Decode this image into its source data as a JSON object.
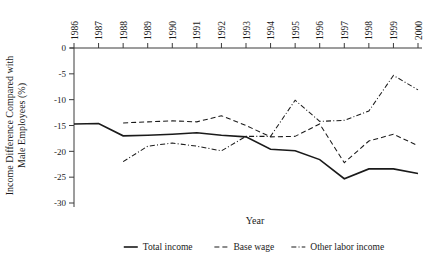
{
  "chart_data": {
    "type": "line",
    "title": "",
    "xlabel": "Year",
    "ylabel": "Income Difference Compared with Male Employees (%)",
    "x": [
      1986,
      1987,
      1988,
      1989,
      1990,
      1991,
      1992,
      1993,
      1994,
      1995,
      1996,
      1997,
      1998,
      1999,
      2000
    ],
    "categories": [
      "1986",
      "1987",
      "1988",
      "1989",
      "1990",
      "1991",
      "1992",
      "1993",
      "1994",
      "1995",
      "1996",
      "1997",
      "1998",
      "1999",
      "2000"
    ],
    "xlim": [
      1986,
      2000
    ],
    "ylim": [
      -30,
      0
    ],
    "yticks": [
      0,
      -5,
      -10,
      -15,
      -20,
      -25,
      -30
    ],
    "yticklabels": [
      "0",
      "-5",
      "-10",
      "-15",
      "-20",
      "-25",
      "-30"
    ],
    "grid": false,
    "legend_position": "bottom",
    "series": [
      {
        "name": "Total income",
        "style": "solid",
        "values": [
          -14.7,
          -14.6,
          -17.0,
          -16.9,
          -16.7,
          -16.4,
          -16.9,
          -17.2,
          -19.6,
          -19.9,
          -21.6,
          -25.3,
          -23.4,
          -23.4,
          -24.3
        ]
      },
      {
        "name": "Base wage",
        "style": "dashed",
        "values": [
          null,
          null,
          -14.5,
          -14.3,
          -14.1,
          -14.3,
          -13.1,
          -15.0,
          -17.2,
          -17.1,
          -14.7,
          -22.2,
          -18.0,
          -16.7,
          -18.9
        ]
      },
      {
        "name": "Other labor income",
        "style": "dash-dot",
        "values": [
          null,
          null,
          -22.0,
          -19.0,
          -18.4,
          -19.0,
          -19.9,
          -17.1,
          -17.1,
          -10.1,
          -14.2,
          -14.0,
          -12.2,
          -5.3,
          -8.1
        ]
      }
    ]
  },
  "legend": {
    "items": [
      {
        "label": "Total income",
        "style": "solid"
      },
      {
        "label": "Base wage",
        "style": "dashed"
      },
      {
        "label": "Other labor income",
        "style": "dash-dot"
      }
    ]
  },
  "colors": {
    "ink": "#1a1a1a",
    "axis": "#3b3b3b",
    "background": "#ffffff"
  }
}
